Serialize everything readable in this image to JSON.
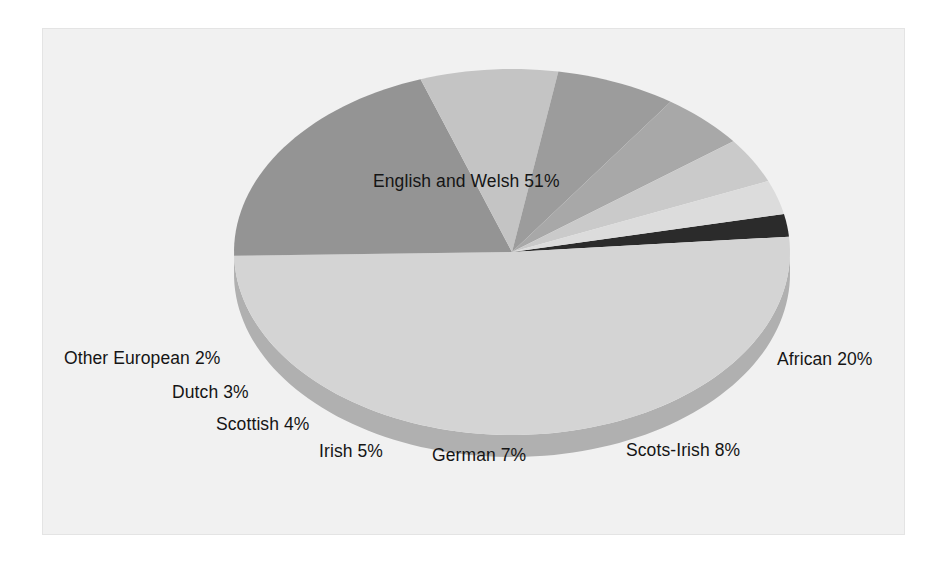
{
  "figure": {
    "panel_background": "#f1f1f1",
    "panel_border": "#e4e4e4",
    "page_background": "#ffffff",
    "label_color": "#151515"
  },
  "chart_data": {
    "type": "pie",
    "title": "",
    "subtitle": "",
    "xlabel": "",
    "ylabel": "",
    "three_d": true,
    "legend_position": "none",
    "labels_inline": true,
    "total_percent": 100,
    "center": {
      "x": 512,
      "y": 252
    },
    "radius_x": 278,
    "radius_y": 183,
    "depth": 22,
    "start_angle_deg": 348,
    "direction": "clockwise",
    "categories": [
      "Other European",
      "English and Welsh",
      "African",
      "Scots-Irish",
      "German",
      "Irish",
      "Scottish",
      "Dutch"
    ],
    "values": [
      2,
      51,
      20,
      8,
      7,
      5,
      4,
      3
    ],
    "slices": [
      {
        "name": "Other European",
        "value": 2,
        "label": "Other European 2%",
        "color": "#2b2b2b",
        "side_color": "#1a1a1a",
        "label_x": 64,
        "label_y": 349
      },
      {
        "name": "English and Welsh",
        "value": 51,
        "label": "English and Welsh 51%",
        "color": "#d4d4d4",
        "side_color": "#b0b0b0",
        "label_x": 373,
        "label_y": 172
      },
      {
        "name": "African",
        "value": 20,
        "label": "African 20%",
        "color": "#949494",
        "side_color": "#7a7a7a",
        "label_x": 777,
        "label_y": 350
      },
      {
        "name": "Scots-Irish",
        "value": 8,
        "label": "Scots-Irish 8%",
        "color": "#c4c4c4",
        "side_color": "#a2a2a2",
        "label_x": 626,
        "label_y": 441
      },
      {
        "name": "German",
        "value": 7,
        "label": "German 7%",
        "color": "#9c9c9c",
        "side_color": "#818181",
        "label_x": 432,
        "label_y": 446
      },
      {
        "name": "Irish",
        "value": 5,
        "label": "Irish 5%",
        "color": "#a8a8a8",
        "side_color": "#8b8b8b",
        "label_x": 319,
        "label_y": 442
      },
      {
        "name": "Scottish",
        "value": 4,
        "label": "Scottish 4%",
        "color": "#cacaca",
        "side_color": "#a8a8a8",
        "label_x": 216,
        "label_y": 415
      },
      {
        "name": "Dutch",
        "value": 3,
        "label": "Dutch 3%",
        "color": "#dcdcdc",
        "side_color": "#b6b6b6",
        "label_x": 172,
        "label_y": 383
      }
    ]
  }
}
